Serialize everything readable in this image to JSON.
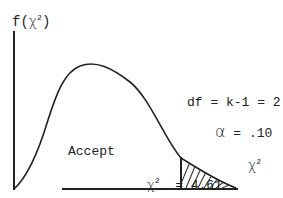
{
  "diagram": {
    "y_axis_label": {
      "func": "f(",
      "sym": "χ",
      "exp": "2",
      "close": ")"
    },
    "x_axis_label": {
      "sym": "χ",
      "exp": "2"
    },
    "df_label": "df = k-1 = 2",
    "alpha_label": {
      "sym": "α",
      "text": "= .10"
    },
    "accept_label": "Accept",
    "critical_label": {
      "sym": "χ",
      "exp": "2",
      "text": "= 4.61"
    },
    "colors": {
      "ink": "#222222",
      "background": "#ffffff"
    }
  }
}
